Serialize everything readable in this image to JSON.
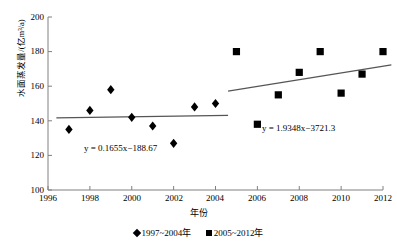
{
  "chart_data": {
    "type": "scatter",
    "title": "",
    "xlabel": "年份",
    "ylabel": "水面蒸发量/(亿m³/a)",
    "xlim": [
      1996,
      2012
    ],
    "ylim": [
      100,
      200
    ],
    "xticks": [
      "1996",
      "1998",
      "2000",
      "2002",
      "2004",
      "2006",
      "2008",
      "2010",
      "2012"
    ],
    "yticks": [
      "100",
      "120",
      "140",
      "160",
      "180",
      "200"
    ],
    "grid": false,
    "legend_position": "bottom",
    "series": [
      {
        "name": "1997~2004年",
        "marker": "diamond",
        "color": "#000000",
        "x": [
          1997,
          1998,
          1999,
          2000,
          2001,
          2002,
          2003,
          2004
        ],
        "values": [
          135,
          146,
          158,
          142,
          137,
          127,
          148,
          150
        ],
        "trendline": {
          "equation": "y = 0.1655x−188.67",
          "slope": 0.1655,
          "intercept": -188.67,
          "x_start": 1996.4,
          "x_end": 2004.6
        }
      },
      {
        "name": "2005~2012年",
        "marker": "square",
        "color": "#000000",
        "x": [
          2005,
          2006,
          2007,
          2008,
          2009,
          2010,
          2011,
          2012
        ],
        "values": [
          180,
          138,
          155,
          168,
          180,
          156,
          167,
          180
        ],
        "trendline": {
          "equation": "y = 1.9348x−3721.3",
          "slope": 1.9348,
          "intercept": -3721.3,
          "x_start": 2004.6,
          "x_end": 2012.4
        }
      }
    ],
    "annotations": [
      {
        "text": "y = 0.1655x−188.67",
        "x_px": 84,
        "y_px": 148
      },
      {
        "text": "y = 1.9348x−3721.3",
        "x_px": 262,
        "y_px": 128
      }
    ]
  },
  "legend": {
    "items": [
      {
        "marker": "diamond",
        "label": "1997~2004年"
      },
      {
        "marker": "square",
        "label": "2005~2012年"
      }
    ]
  }
}
